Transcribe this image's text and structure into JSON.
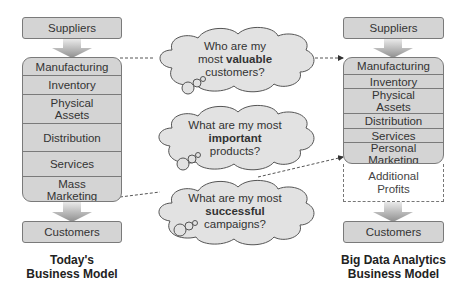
{
  "left_model": {
    "top_box": "Suppliers",
    "rows": [
      "Manufacturing",
      "Inventory",
      "Physical Assets",
      "Distribution",
      "Services",
      "Mass Marketing"
    ],
    "bottom_box": "Customers",
    "caption_line1": "Today's",
    "caption_line2": "Business Model"
  },
  "right_model": {
    "top_box": "Suppliers",
    "rows": [
      "Manufacturing",
      "Inventory",
      "Physical Assets",
      "Distribution",
      "Services",
      "Personal Marketing"
    ],
    "extra_box": "Additional Profits",
    "bottom_box": "Customers",
    "caption_line1": "Big Data Analytics",
    "caption_line2": "Business Model"
  },
  "clouds": [
    {
      "pre": "Who are my",
      "mid_pre": "most ",
      "bold": "valuable",
      "post": "customers?"
    },
    {
      "pre": "What are my most",
      "mid_pre": "",
      "bold": "important",
      "post": "products?"
    },
    {
      "pre": "What are my most",
      "mid_pre": "",
      "bold": "successful",
      "post": "campaigns?"
    }
  ],
  "colors": {
    "box_fill": "#d4d4d4",
    "box_border": "#7a7a7a",
    "arrow_fill": "#a8a8a8",
    "cloud_fill": "#e2e2e2"
  }
}
